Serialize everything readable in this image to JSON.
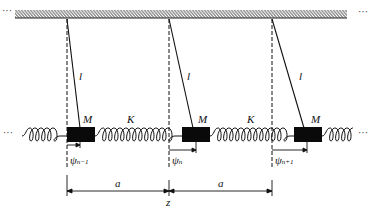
{
  "diagram": {
    "type": "coupled-pendulum-chain",
    "ellipsis_left_top": "···",
    "ellipsis_right_top": "···",
    "ellipsis_left_spring": "···",
    "ellipsis_right_spring": "···",
    "pendulum_length_label": "l",
    "mass_label": "M",
    "spring_label": "K",
    "spacing_label": "a",
    "axis_label": "z",
    "displacements": [
      {
        "symbol": "ψ",
        "subscript": "n−1"
      },
      {
        "symbol": "ψ",
        "subscript": "n"
      },
      {
        "symbol": "ψ",
        "subscript": "n+1"
      }
    ],
    "colors": {
      "line": "#111111",
      "mass": "#0a0a0a",
      "hatch": "#333333"
    }
  }
}
